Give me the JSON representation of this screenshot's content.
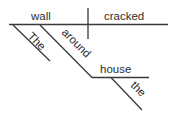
{
  "diagram": {
    "type": "sentence-diagram",
    "subject": "wall",
    "verb": "cracked",
    "modifiers": {
      "subject_article": "The",
      "preposition": "around",
      "object_of_preposition": "house",
      "object_article": "the"
    },
    "colors": {
      "ink": "#2e2e2e",
      "background": "#ffffff"
    }
  }
}
